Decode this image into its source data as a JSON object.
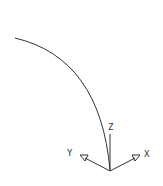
{
  "drawing": {
    "stroke_color": "#333333",
    "background": "#ffffff",
    "arc": {
      "label": "arc"
    },
    "ucs_icon": {
      "axes": [
        {
          "name": "X",
          "label": "X"
        },
        {
          "name": "Y",
          "label": "Y"
        },
        {
          "name": "Z",
          "label": "Z"
        }
      ]
    }
  }
}
